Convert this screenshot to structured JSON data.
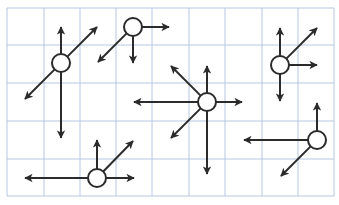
{
  "diagram": {
    "colors": {
      "background": "#ffffff",
      "grid": "#b7c6e2",
      "arrow": "#2b2b2b",
      "node_fill": "#ffffff",
      "node_stroke": "#2b2b2b"
    },
    "grid": {
      "x": [
        7,
        44,
        80,
        116,
        152,
        189,
        225,
        262,
        298,
        334
      ],
      "y": [
        8,
        45,
        83,
        121,
        159,
        196
      ]
    },
    "node_radius": 9,
    "nodes": [
      {
        "id": "node-1",
        "cx": 61,
        "cy": 63,
        "vectors": [
          {
            "dir": "up",
            "x2": 61,
            "y2": 27,
            "head": true
          },
          {
            "dir": "up-right",
            "x2": 97,
            "y2": 27,
            "head": true
          },
          {
            "dir": "down-left",
            "x2": 25,
            "y2": 99,
            "head": true
          },
          {
            "dir": "down",
            "x2": 61,
            "y2": 138,
            "head": true
          }
        ]
      },
      {
        "id": "node-2",
        "cx": 133,
        "cy": 27,
        "vectors": [
          {
            "dir": "right",
            "x2": 169,
            "y2": 27,
            "head": true
          },
          {
            "dir": "down-left",
            "x2": 98,
            "y2": 62,
            "head": true
          },
          {
            "dir": "down",
            "x2": 133,
            "y2": 63,
            "head": true
          }
        ]
      },
      {
        "id": "node-3",
        "cx": 207,
        "cy": 102,
        "vectors": [
          {
            "dir": "up",
            "x2": 207,
            "y2": 66,
            "head": true
          },
          {
            "dir": "up-left",
            "x2": 171,
            "y2": 66,
            "head": true
          },
          {
            "dir": "left",
            "x2": 134,
            "y2": 102,
            "head": true
          },
          {
            "dir": "right",
            "x2": 242,
            "y2": 102,
            "head": true
          },
          {
            "dir": "down-left",
            "x2": 171,
            "y2": 138,
            "head": true
          },
          {
            "dir": "down",
            "x2": 207,
            "y2": 174,
            "head": true
          }
        ]
      },
      {
        "id": "node-4",
        "cx": 280,
        "cy": 65,
        "vectors": [
          {
            "dir": "up",
            "x2": 280,
            "y2": 28,
            "head": true
          },
          {
            "dir": "up-right",
            "x2": 317,
            "y2": 28,
            "head": true
          },
          {
            "dir": "right",
            "x2": 317,
            "y2": 65,
            "head": true
          },
          {
            "dir": "down",
            "x2": 280,
            "y2": 101,
            "head": true
          }
        ]
      },
      {
        "id": "node-5",
        "cx": 97,
        "cy": 178,
        "vectors": [
          {
            "dir": "left",
            "x2": 25,
            "y2": 178,
            "head": true
          },
          {
            "dir": "up",
            "x2": 97,
            "y2": 140,
            "head": true
          },
          {
            "dir": "up-right",
            "x2": 133,
            "y2": 141,
            "head": true
          },
          {
            "dir": "right",
            "x2": 134,
            "y2": 178,
            "head": true
          }
        ]
      },
      {
        "id": "node-6",
        "cx": 317,
        "cy": 140,
        "vectors": [
          {
            "dir": "up",
            "x2": 317,
            "y2": 103,
            "head": true
          },
          {
            "dir": "left",
            "x2": 244,
            "y2": 140,
            "head": true
          },
          {
            "dir": "down-left",
            "x2": 281,
            "y2": 176,
            "head": true
          }
        ]
      }
    ]
  }
}
